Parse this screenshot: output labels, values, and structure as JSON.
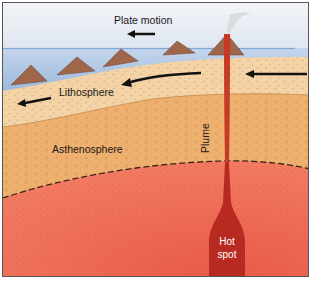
{
  "diagram": {
    "labels": {
      "plate_motion": "Plate motion",
      "lithosphere": "Lithosphere",
      "asthenosphere": "Asthenosphere",
      "plume": "Plume",
      "hot_spot_line1": "Hot",
      "hot_spot_line2": "spot"
    },
    "layers": [
      {
        "name": "sky",
        "color": "#e4e9f2"
      },
      {
        "name": "ocean",
        "color": "#a9c3e2"
      },
      {
        "name": "lithosphere",
        "color": "#f4d3a6"
      },
      {
        "name": "asthenosphere",
        "color": "#eeb06e"
      },
      {
        "name": "mantle",
        "color": "#ef6f59"
      },
      {
        "name": "plume",
        "color": "#b8291f"
      }
    ],
    "volcanoes": 6,
    "arrows": [
      "plate-motion-arrow",
      "lithosphere-arrow-left",
      "lithosphere-arrow-middle",
      "lithosphere-arrow-right"
    ]
  }
}
